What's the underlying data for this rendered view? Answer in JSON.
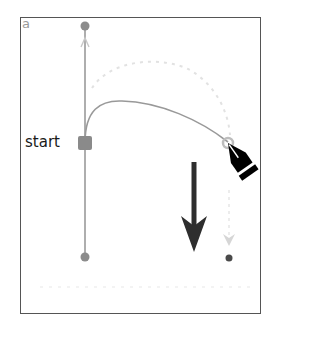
{
  "figure": {
    "panel_label": "a",
    "anchor_label": "start"
  },
  "colors": {
    "frame": "#555555",
    "handle_line": "#9a9a9a",
    "anchor_point": "#8a8a8a",
    "curve": "#9a9a9a",
    "direction_arrow": "#2e2e2e",
    "pen_tool": "#000000",
    "ghost": "#d8d8d8"
  },
  "elements": {
    "handle_top_point": {
      "x": 85,
      "y": 26
    },
    "handle_bottom_point": {
      "x": 85,
      "y": 257
    },
    "anchor_start": {
      "x": 85,
      "y": 143
    },
    "curve_end_point": {
      "x": 228,
      "y": 143
    },
    "drag_target_point": {
      "x": 229,
      "y": 258
    },
    "drag_arrow": {
      "x": 194,
      "y_start": 162,
      "y_end": 252
    }
  }
}
